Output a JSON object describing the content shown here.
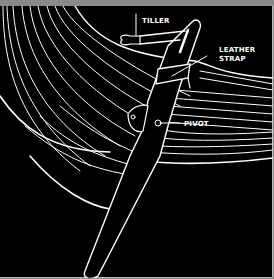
{
  "diagram": {
    "labels": {
      "tiller": "TILLER",
      "leather_strap_line1": "LEATHER",
      "leather_strap_line2": "STRAP",
      "pivot": "PIVOT"
    },
    "colors": {
      "background": "#000000",
      "linework": "#ffffff",
      "frame": "#8a8a8a"
    }
  }
}
